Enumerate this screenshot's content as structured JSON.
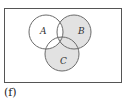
{
  "figure": {
    "caption": "(f)",
    "sets": [
      {
        "label": "A",
        "cx": 46,
        "cy": 32,
        "r": 17
      },
      {
        "label": "B",
        "cx": 74,
        "cy": 32,
        "r": 17
      },
      {
        "label": "C",
        "cx": 62,
        "cy": 54,
        "r": 17
      }
    ],
    "shaded_regions": [
      "B only",
      "C only",
      "B∩C only",
      "A∩B∩C"
    ],
    "colors": {
      "shade": "#e2e2e2",
      "stroke": "#6b6b6b",
      "frame": "#555555"
    }
  }
}
